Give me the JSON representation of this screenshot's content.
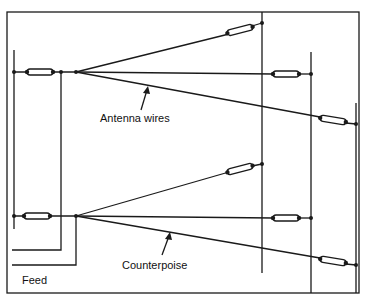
{
  "labels": {
    "antenna_wires": "Antenna wires",
    "counterpoise": "Counterpoise",
    "feed": "Feed"
  },
  "colors": {
    "line": "#1a1a1a",
    "background": "#ffffff"
  }
}
